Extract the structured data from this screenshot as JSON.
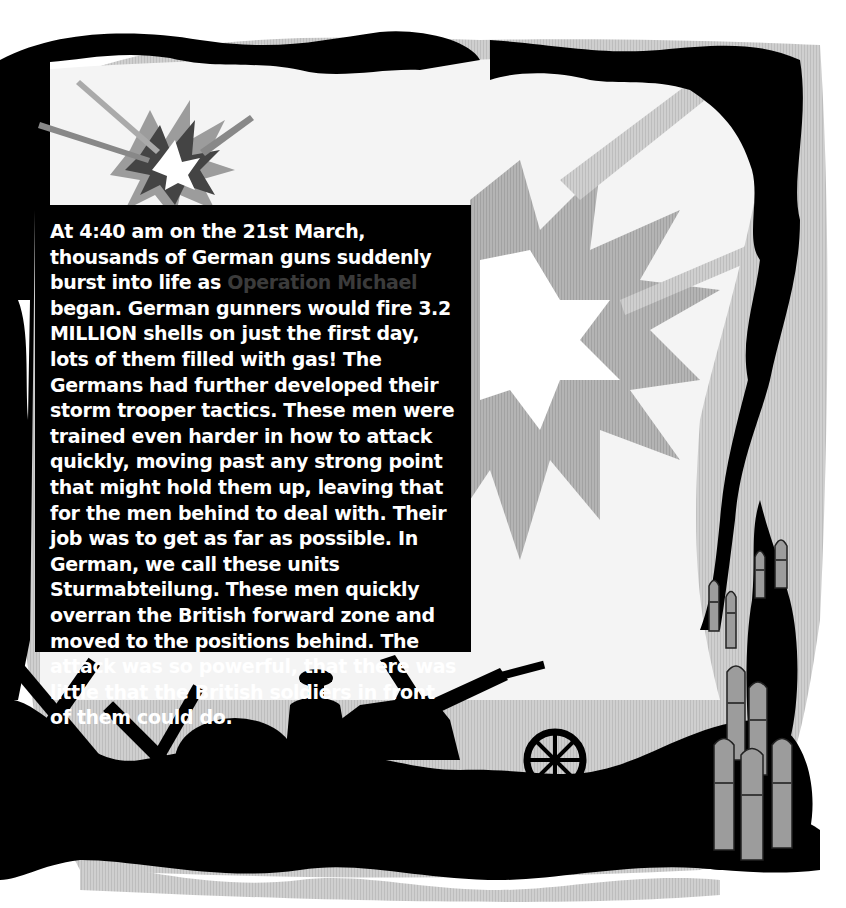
{
  "illustration": {
    "theme": "WWI battlefield - explosions, black smoke frame, barbed-wire crosses, soldier with field gun, artillery shells",
    "colors": {
      "background": "#ffffff",
      "frame": "#000000",
      "gray_light": "#d4d4d4",
      "gray_mid": "#a8a8a8",
      "gray_dark": "#5a5a5a",
      "shell": "#9a9a9a"
    },
    "icons": [
      "explosion-icon",
      "smoke-frame",
      "barbed-wire-cross-icon",
      "soldier-silhouette",
      "field-gun-icon",
      "artillery-shell-icon"
    ]
  },
  "text_box": {
    "highlight_color": "#3b3b3b",
    "segments": {
      "before": "At 4:40 am on the 21st March, thousands of German guns suddenly burst into life as ",
      "highlight": "Operation Michael",
      "after": " began. German gunners would fire 3.2 MILLION shells on just the first day, lots of them filled with gas! The Germans had further developed their storm trooper tactics. These men were trained even harder in how to attack quickly, moving past any strong point that might hold them up, leaving that for the men behind to deal with. Their job was to get as far as possible. In German, we call these units Sturmabteilung. These men quickly overran the British forward zone and moved to the positions behind. The attack was so powerful, that there was little that the British soldiers in front of them could do."
    }
  }
}
